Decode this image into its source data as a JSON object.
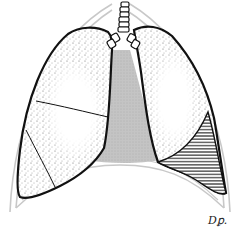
{
  "figure": {
    "signature": "Dꝑ.",
    "colors": {
      "outline": "#111111",
      "stipple": "#555555",
      "mediastinum_fill": "#bdbdbd",
      "thorax_outline": "#c8c8c8",
      "hatch": "#222222",
      "background": "#ffffff"
    },
    "regions": [
      {
        "name": "right-lung",
        "fill": "stippled",
        "lobes": 3
      },
      {
        "name": "left-lung",
        "fill": "stippled"
      },
      {
        "name": "mediastinum",
        "fill": "gray-shaded"
      },
      {
        "name": "trachea",
        "fill": "ringed"
      },
      {
        "name": "left-lower-hatched-region",
        "fill": "horizontal-hatch"
      },
      {
        "name": "thoracic-cage-outline",
        "fill": "none"
      }
    ]
  }
}
